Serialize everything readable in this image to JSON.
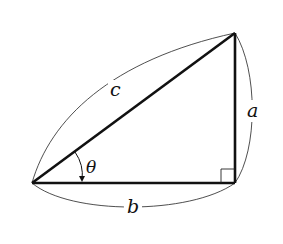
{
  "diagram": {
    "type": "right-triangle",
    "labels": {
      "hypotenuse": "c",
      "opposite": "a",
      "adjacent": "b",
      "angle": "θ"
    },
    "vertices": {
      "left": [
        32,
        183
      ],
      "bottom_right": [
        235,
        183
      ],
      "top_right": [
        235,
        33
      ]
    },
    "right_angle_marker": true,
    "colors": {
      "line": "#111111",
      "background": "#ffffff"
    }
  }
}
